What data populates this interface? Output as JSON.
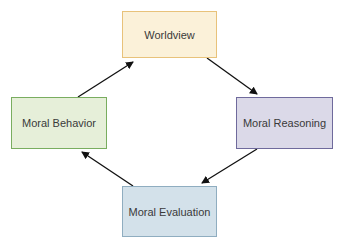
{
  "diagram": {
    "type": "cycle",
    "direction": "clockwise",
    "nodes": [
      {
        "id": "worldview",
        "label": "Worldview",
        "fill": "#fbf1d9",
        "stroke": "#e8c27a"
      },
      {
        "id": "reasoning",
        "label": "Moral Reasoning",
        "fill": "#dbd9e8",
        "stroke": "#6f6a9c"
      },
      {
        "id": "evaluation",
        "label": "Moral Evaluation",
        "fill": "#d3e1ea",
        "stroke": "#8fadc0"
      },
      {
        "id": "behavior",
        "label": "Moral Behavior",
        "fill": "#e6efd9",
        "stroke": "#79ad5f"
      }
    ],
    "edges": [
      {
        "from": "behavior",
        "to": "worldview"
      },
      {
        "from": "worldview",
        "to": "reasoning"
      },
      {
        "from": "reasoning",
        "to": "evaluation"
      },
      {
        "from": "evaluation",
        "to": "behavior"
      }
    ]
  }
}
